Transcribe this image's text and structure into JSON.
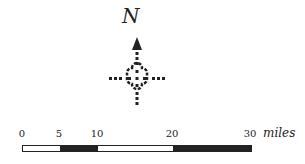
{
  "compass": {
    "north_label": "N",
    "icon": "north-arrow-icon",
    "colors": {
      "ink": "#222222"
    }
  },
  "scale": {
    "unit": "miles",
    "ticks": [
      {
        "value": 0,
        "label": "0"
      },
      {
        "value": 5,
        "label": "5"
      },
      {
        "value": 10,
        "label": "10"
      },
      {
        "value": 20,
        "label": "20"
      },
      {
        "value": 30,
        "label": "30"
      }
    ],
    "segments": [
      {
        "from": 0,
        "to": 5,
        "fill": "#ffffff"
      },
      {
        "from": 5,
        "to": 10,
        "fill": "#222222"
      },
      {
        "from": 10,
        "to": 20,
        "fill": "#ffffff"
      },
      {
        "from": 20,
        "to": 30,
        "fill": "#222222"
      }
    ],
    "max": 30
  }
}
